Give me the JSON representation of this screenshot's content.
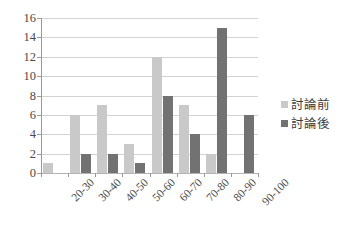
{
  "chart_data": {
    "type": "bar",
    "title": "",
    "subtitle": "",
    "xlabel": "",
    "ylabel": "",
    "categories": [
      "20-30",
      "30-40",
      "40-50",
      "50-60",
      "60-70",
      "70-80",
      "80-90",
      "90-100"
    ],
    "series": [
      {
        "name": "討論前",
        "color": "#c9c9c9",
        "values": [
          1,
          6,
          7,
          3,
          12,
          7,
          2,
          0
        ]
      },
      {
        "name": "討論後",
        "color": "#727272",
        "values": [
          0,
          2,
          2,
          1,
          8,
          4,
          15,
          6
        ]
      }
    ],
    "ylim": [
      0,
      16
    ],
    "ytick_step": 2,
    "yticks": [
      16,
      14,
      12,
      10,
      8,
      6,
      4,
      2,
      0
    ],
    "grid": true,
    "legend_position": "right",
    "annotations": []
  },
  "legend": {
    "entries": [
      {
        "label": "討論前",
        "marker": "square-swatch-light"
      },
      {
        "label": "討論後",
        "marker": "square-swatch-dark"
      }
    ]
  },
  "colors": {
    "series_before": "#c9c9c9",
    "series_after": "#727272",
    "gridline": "#d2d2d2",
    "axis": "#9a9a9a",
    "text": "#3a3a3a",
    "background": "#ffffff"
  }
}
